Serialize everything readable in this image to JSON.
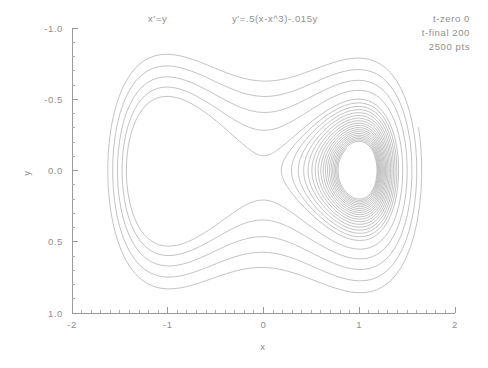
{
  "annotations": {
    "equation_x": "x'=y",
    "equation_y": "y'=.5(x-x^3)-.015y",
    "t_zero": "t-zero 0",
    "t_final": "t-final 200",
    "points": "2500 pts"
  },
  "axes": {
    "xlabel": "x",
    "ylabel": "y",
    "xticks": [
      "-2",
      "-1",
      "0",
      "1",
      "2"
    ],
    "yticks": [
      "1.0",
      "0.5",
      "0.0",
      "-0.5",
      "-1.0"
    ]
  },
  "colors": {
    "line": "#9b9b9b",
    "axis": "#9a9a9a",
    "text": "#8f8f8f",
    "background": "#ffffff"
  },
  "chart_data": {
    "type": "line",
    "title": "",
    "subtitle": "",
    "xlabel": "x",
    "ylabel": "y",
    "xlim": [
      -2,
      2
    ],
    "ylim": [
      -1.0,
      1.0
    ],
    "xticks": [
      -2,
      -1,
      0,
      1,
      2
    ],
    "yticks": [
      -1.0,
      -0.5,
      0.0,
      0.5,
      1.0
    ],
    "x_minor_step": 0.1,
    "y_minor_step": 0.1,
    "grid": false,
    "legend": false,
    "system": {
      "name": "Duffing oscillator (unforced, damped double-well)",
      "dx_dt": "x' = y",
      "dy_dt": "y' = 0.5*(x - x^3) - 0.015*y",
      "alpha": 0.5,
      "damping": 0.015,
      "t_zero": 0,
      "t_final": 200,
      "n_points": 2500,
      "initial_condition": [
        1.62,
        0.3
      ],
      "fixed_points": [
        {
          "x": -1.0,
          "y": 0.0,
          "kind": "stable-spiral"
        },
        {
          "x": 0.0,
          "y": 0.0,
          "kind": "saddle"
        },
        {
          "x": 1.0,
          "y": 0.0,
          "kind": "stable-spiral"
        }
      ]
    },
    "series": [
      {
        "name": "trajectory",
        "description": "Single damped orbit spiralling inward, crossing the saddle separatrix and filling both wells of the figure-eight.",
        "color": "#9b9b9b"
      }
    ],
    "annotations": [
      {
        "text": "x'=y",
        "x_px": 148,
        "y_px": 22
      },
      {
        "text": "y'=.5(x-x^3)-.015y",
        "x_px": 232,
        "y_px": 22
      },
      {
        "text": "t-zero 0",
        "x_px": 470,
        "y_px": 22
      },
      {
        "text": "t-final 200",
        "x_px": 470,
        "y_px": 36
      },
      {
        "text": "2500 pts",
        "x_px": 470,
        "y_px": 50
      }
    ]
  }
}
